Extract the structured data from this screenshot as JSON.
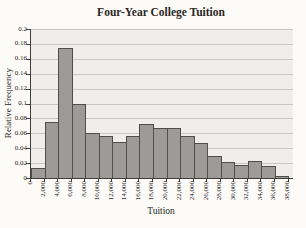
{
  "chart_data": {
    "type": "bar",
    "subtype": "histogram",
    "title": "Four-Year College Tuition",
    "xlabel": "Tuition",
    "ylabel": "Relative Frequency",
    "bin_edge_labels": [
      "0",
      "2,000",
      "4,000",
      "6,000",
      "8,000",
      "10,000",
      "12,000",
      "14,000",
      "16,000",
      "18,000",
      "20,000",
      "22,000",
      "24,000",
      "26,000",
      "28,000",
      "30,000",
      "32,000",
      "34,000",
      "36,000",
      "38,000"
    ],
    "bin_width": 2000,
    "values": [
      0.013,
      0.075,
      0.175,
      0.1,
      0.061,
      0.057,
      0.048,
      0.057,
      0.072,
      0.067,
      0.067,
      0.056,
      0.047,
      0.03,
      0.022,
      0.018,
      0.023,
      0.016,
      0.003
    ],
    "ylim": [
      0,
      0.2
    ],
    "ytick_labels": [
      "0",
      "0.02",
      "0.04",
      "0.06",
      "0.08",
      "0.1",
      "0.12",
      "0.14",
      "0.16",
      "0.18",
      "0.2"
    ],
    "grid": true,
    "legend": false,
    "xtick_label_rotation_deg": 90,
    "colors": {
      "background": "#fcfbf8",
      "plot_bg": "#efeeeb",
      "gridline": "#c9c7c3",
      "bar_fill": "#9c9b98",
      "bar_border": "#4f4e4b",
      "axis": "#403e3a",
      "text": "#2b2723"
    }
  }
}
